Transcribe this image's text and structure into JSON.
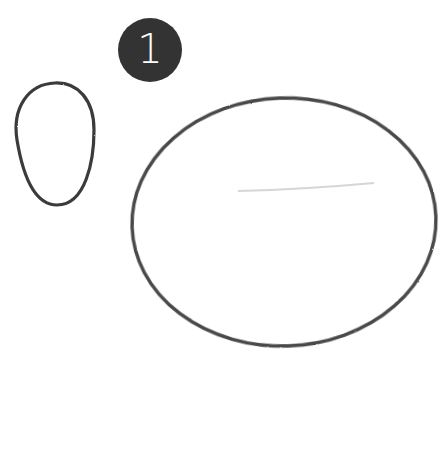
{
  "step": {
    "number": "1",
    "badge_color": "#333333",
    "text_color": "#ffffff"
  },
  "drawing": {
    "stroke_color": "#3a3a3a",
    "guide_color": "#d6d6d6",
    "shapes": [
      {
        "name": "small-egg-shape"
      },
      {
        "name": "large-oval-shape"
      },
      {
        "name": "guide-line"
      }
    ]
  }
}
